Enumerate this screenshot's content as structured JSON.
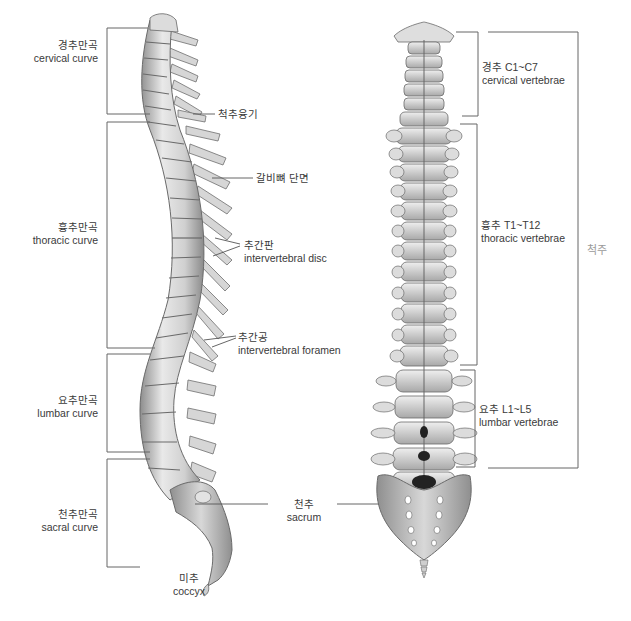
{
  "diagram": {
    "lateral_view": {
      "curves": [
        {
          "ko": "경추만곡",
          "en": "cervical curve"
        },
        {
          "ko": "흉추만곡",
          "en": "thoracic curve"
        },
        {
          "ko": "요추만곡",
          "en": "lumbar curve"
        },
        {
          "ko": "천추만곡",
          "en": "sacral curve"
        }
      ],
      "callouts": [
        {
          "ko": "척추융기",
          "en": ""
        },
        {
          "ko": "갈비뼈 단면",
          "en": ""
        },
        {
          "ko": "추간판",
          "en": "intervertebral disc"
        },
        {
          "ko": "추간공",
          "en": "intervertebral foramen"
        },
        {
          "ko": "미추",
          "en": "coccyx"
        }
      ]
    },
    "shared": {
      "sacrum": {
        "ko": "천추",
        "en": "sacrum"
      }
    },
    "posterior_view": {
      "regions": [
        {
          "ko": "경추 C1~C7",
          "en": "cervical vertebrae"
        },
        {
          "ko": "흉추 T1~T12",
          "en": "thoracic vertebrae"
        },
        {
          "ko": "요추 L1~L5",
          "en": "lumbar vertebrae"
        }
      ],
      "whole_label": "척주"
    },
    "colors": {
      "bone_light": "#e6e6e6",
      "bone_mid": "#bdbdbd",
      "bone_dark": "#7a7a7a",
      "line": "#555555",
      "text": "#3a3a3a",
      "spine_label": "#9a9a9a"
    }
  }
}
